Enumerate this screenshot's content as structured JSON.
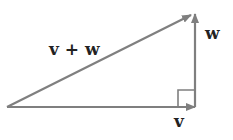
{
  "diagram": {
    "type": "vector-addition-right-triangle",
    "labels": {
      "sum": "v + w",
      "w": "w",
      "v": "v"
    },
    "colors": {
      "arrow": "#7f7f7f",
      "text": "#222222",
      "background": "#ffffff"
    },
    "right_angle_marker": true
  }
}
